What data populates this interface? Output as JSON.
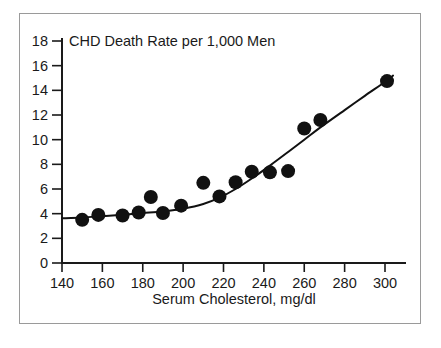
{
  "figure": {
    "background_color": "#ffffff",
    "frame_color": "#9a9a9a",
    "ink_color": "#111111"
  },
  "chart_data": {
    "type": "scatter",
    "title": "CHD Death Rate per 1,000 Men",
    "subtitle": "",
    "xlabel": "Serum Cholesterol, mg/dl",
    "ylabel": "",
    "xlim": [
      140,
      306
    ],
    "ylim": [
      0,
      18
    ],
    "xticks": [
      140,
      160,
      180,
      200,
      220,
      240,
      260,
      280,
      300
    ],
    "xtick_labels": [
      "140",
      "160",
      "180",
      "200",
      "220",
      "240",
      "260",
      "280",
      "300"
    ],
    "yticks": [
      0,
      2,
      4,
      6,
      8,
      10,
      12,
      14,
      16,
      18
    ],
    "ytick_labels": [
      "0",
      "2",
      "4",
      "6",
      "8",
      "10",
      "12",
      "14",
      "16",
      "18"
    ],
    "grid": false,
    "legend": false,
    "legend_position": "none",
    "marker_style": "filled-circle",
    "marker_color": "#111111",
    "marker_radius_px": 7,
    "x": [
      150,
      158,
      170,
      178,
      184,
      190,
      199,
      210,
      218,
      226,
      234,
      243,
      252,
      260,
      268,
      301
    ],
    "y": [
      3.5,
      3.9,
      3.85,
      4.1,
      5.35,
      4.05,
      4.65,
      6.5,
      5.4,
      6.55,
      7.4,
      7.35,
      7.45,
      10.9,
      11.6,
      14.75
    ],
    "series": [
      {
        "name": "CHD death rate",
        "type": "scatter",
        "points": [
          {
            "x": 150,
            "y": 3.5
          },
          {
            "x": 158,
            "y": 3.9
          },
          {
            "x": 170,
            "y": 3.85
          },
          {
            "x": 178,
            "y": 4.1
          },
          {
            "x": 184,
            "y": 5.35
          },
          {
            "x": 190,
            "y": 4.05
          },
          {
            "x": 199,
            "y": 4.65
          },
          {
            "x": 210,
            "y": 6.5
          },
          {
            "x": 218,
            "y": 5.4
          },
          {
            "x": 226,
            "y": 6.55
          },
          {
            "x": 234,
            "y": 7.4
          },
          {
            "x": 243,
            "y": 7.35
          },
          {
            "x": 252,
            "y": 7.45
          },
          {
            "x": 260,
            "y": 10.9
          },
          {
            "x": 268,
            "y": 11.6
          },
          {
            "x": 301,
            "y": 14.75
          }
        ]
      },
      {
        "name": "fitted curve",
        "type": "line",
        "color": "#111111",
        "points": [
          {
            "x": 140,
            "y": 3.62
          },
          {
            "x": 150,
            "y": 3.68
          },
          {
            "x": 160,
            "y": 3.8
          },
          {
            "x": 170,
            "y": 3.92
          },
          {
            "x": 180,
            "y": 4.05
          },
          {
            "x": 190,
            "y": 4.18
          },
          {
            "x": 200,
            "y": 4.4
          },
          {
            "x": 210,
            "y": 4.78
          },
          {
            "x": 218,
            "y": 5.3
          },
          {
            "x": 226,
            "y": 6.0
          },
          {
            "x": 234,
            "y": 6.85
          },
          {
            "x": 243,
            "y": 7.9
          },
          {
            "x": 252,
            "y": 9.0
          },
          {
            "x": 260,
            "y": 10.0
          },
          {
            "x": 268,
            "y": 11.0
          },
          {
            "x": 280,
            "y": 12.4
          },
          {
            "x": 290,
            "y": 13.55
          },
          {
            "x": 301,
            "y": 14.8
          },
          {
            "x": 304,
            "y": 15.2
          }
        ]
      }
    ],
    "annotations": []
  }
}
